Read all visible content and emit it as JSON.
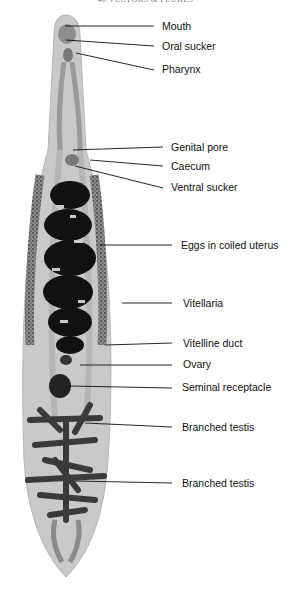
{
  "header": {
    "running_title": "40 VECTORS & FLUKES"
  },
  "diagram": {
    "labels": [
      {
        "id": "mouth",
        "text": "Mouth",
        "x": 162,
        "y": 20
      },
      {
        "id": "oral-sucker",
        "text": "Oral sucker",
        "x": 162,
        "y": 40
      },
      {
        "id": "pharynx",
        "text": "Pharynx",
        "x": 162,
        "y": 63
      },
      {
        "id": "genital-pore",
        "text": "Genital pore",
        "x": 171,
        "y": 141
      },
      {
        "id": "caecum",
        "text": "Caecum",
        "x": 171,
        "y": 160
      },
      {
        "id": "ventral-sucker",
        "text": "Ventral sucker",
        "x": 171,
        "y": 181
      },
      {
        "id": "eggs-in-coiled-uterus",
        "text": "Eggs in coiled uterus",
        "x": 181,
        "y": 239
      },
      {
        "id": "vitellaria",
        "text": "Vitellaria",
        "x": 183,
        "y": 297
      },
      {
        "id": "vitelline-duct",
        "text": "Vitelline duct",
        "x": 183,
        "y": 337
      },
      {
        "id": "ovary",
        "text": "Ovary",
        "x": 183,
        "y": 358
      },
      {
        "id": "seminal-receptacle",
        "text": "Seminal receptacle",
        "x": 182,
        "y": 381
      },
      {
        "id": "branched-testis-1",
        "text": "Branched testis",
        "x": 182,
        "y": 421
      },
      {
        "id": "branched-testis-2",
        "text": "Branched testis",
        "x": 182,
        "y": 477
      }
    ]
  }
}
